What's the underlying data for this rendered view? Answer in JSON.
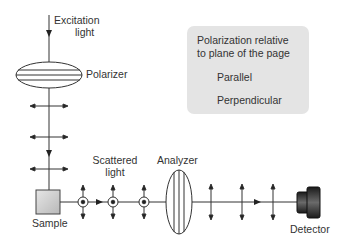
{
  "diagram": {
    "labels": {
      "excitation": [
        "Excitation",
        "light"
      ],
      "polarizer": "Polarizer",
      "scattered": [
        "Scattered",
        "light"
      ],
      "analyzer": "Analyzer",
      "sample": "Sample",
      "detector": "Detector"
    },
    "legend": {
      "title_line1": "Polarization relative",
      "title_line2": "to plane of the page",
      "items": [
        {
          "icon": "double-arrow-vertical-icon",
          "label": "Parallel"
        },
        {
          "icon": "circled-dot-icon",
          "label": "Perpendicular"
        }
      ]
    },
    "colors": {
      "line": "#333333",
      "legend_bg": "#e4e4e4",
      "sample_fill": "#cfcfcf",
      "detector_fill": "#2a2a2a"
    }
  }
}
